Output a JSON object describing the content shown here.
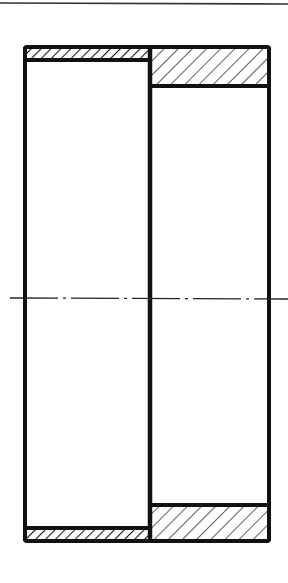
{
  "diagram": {
    "type": "mechanical-section-drawing",
    "colors": {
      "line": "#111111",
      "background": "#ffffff",
      "hatch": "#1a1a1a",
      "top_rule": "#333333"
    },
    "elements": {
      "top_rule": {
        "y": 3
      },
      "outer_outline": {
        "x1": 25,
        "y1": 47,
        "x2": 269,
        "y2": 541
      },
      "left_bore": {
        "x1": 25,
        "y1": 60,
        "x2": 150,
        "y2": 528
      },
      "right_bore": {
        "x1": 150,
        "y1": 86,
        "x2": 269,
        "y2": 505
      },
      "centerline": {
        "y": 298,
        "x1": 10,
        "x2": 288
      }
    }
  }
}
